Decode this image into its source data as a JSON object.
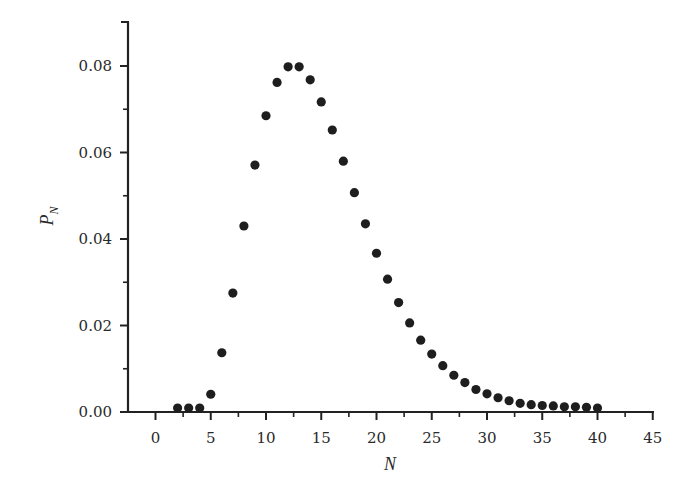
{
  "chart_data": {
    "type": "scatter",
    "title": "",
    "xlabel": "N",
    "ylabel": "P_N",
    "ylabel_main": "P",
    "ylabel_sub": "N",
    "xlim": [
      -2.5,
      45
    ],
    "ylim": [
      0,
      0.09
    ],
    "grid": false,
    "legend": null,
    "x_ticks": [
      0,
      5,
      10,
      15,
      20,
      25,
      30,
      35,
      40,
      45
    ],
    "x_tick_labels": [
      "0",
      "5",
      "10",
      "15",
      "20",
      "25",
      "30",
      "35",
      "40",
      "45"
    ],
    "y_ticks": [
      0.0,
      0.02,
      0.04,
      0.06,
      0.08
    ],
    "y_tick_labels": [
      "0.00",
      "0.02",
      "0.04",
      "0.06",
      "0.08"
    ],
    "series": [
      {
        "name": "P_N",
        "marker": "filled-circle",
        "color": "#1e1e1e",
        "x": [
          2,
          3,
          4,
          5,
          6,
          7,
          8,
          9,
          10,
          11,
          12,
          13,
          14,
          15,
          16,
          17,
          18,
          19,
          20,
          21,
          22,
          23,
          24,
          25,
          26,
          27,
          28,
          29,
          30,
          31,
          32,
          33,
          34,
          35,
          36,
          37,
          38,
          39,
          40
        ],
        "y": [
          0.0003,
          0.0005,
          0.0005,
          0.0041,
          0.0137,
          0.0275,
          0.043,
          0.0571,
          0.0685,
          0.0762,
          0.0798,
          0.0798,
          0.0768,
          0.0717,
          0.0652,
          0.058,
          0.0507,
          0.0435,
          0.0367,
          0.0307,
          0.0253,
          0.0206,
          0.0166,
          0.0134,
          0.0107,
          0.0085,
          0.0068,
          0.0052,
          0.0042,
          0.0033,
          0.0026,
          0.002,
          0.0017,
          0.0015,
          0.0014,
          0.0012,
          0.0012,
          0.0011,
          0.0009
        ]
      }
    ]
  },
  "colors": {
    "axis": "#222222",
    "marker": "#1e1e1e",
    "text": "#2a2a2a",
    "background": "#ffffff"
  }
}
